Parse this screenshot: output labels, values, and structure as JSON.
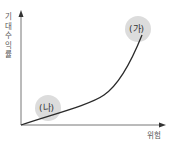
{
  "diagram": {
    "y_axis_label": "기대수익률",
    "x_axis_label": "위험",
    "points": [
      {
        "label": "(가)",
        "description": "high risk, high expected return"
      },
      {
        "label": "(나)",
        "description": "low risk, low expected return"
      }
    ],
    "colors": {
      "axis": "#666666",
      "curve": "#2a2a2a",
      "bubble": "#dcdcdc"
    }
  }
}
